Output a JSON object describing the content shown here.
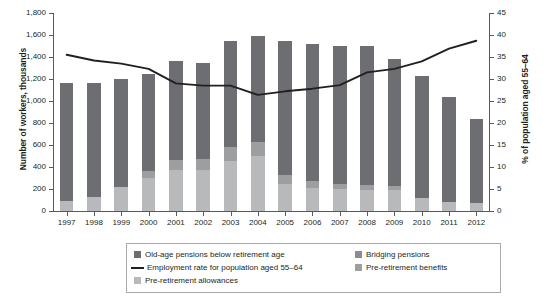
{
  "chart_data": {
    "type": "bar",
    "subtype": "stacked-bar-with-line-overlay",
    "title": "",
    "xlabel": "",
    "ylabel": "Number of workers, thousands",
    "y2label": "% of population aged 55–64",
    "ylim": [
      0,
      1800
    ],
    "y2lim": [
      0,
      45
    ],
    "ytick_step": 200,
    "y2tick_step": 5,
    "grid": false,
    "legend_position": "bottom",
    "categories": [
      "1997",
      "1998",
      "1999",
      "2000",
      "2001",
      "2002",
      "2003",
      "2004",
      "2005",
      "2006",
      "2007",
      "2008",
      "2009",
      "2010",
      "2011",
      "2012"
    ],
    "ytick_labels": [
      "0",
      "200",
      "400",
      "600",
      "800",
      "1,000",
      "1,200",
      "1,400",
      "1,600",
      "1,800"
    ],
    "y2tick_labels": [
      "0",
      "5",
      "10",
      "15",
      "20",
      "25",
      "30",
      "35",
      "40",
      "45"
    ],
    "series": [
      {
        "name": "Pre-retirement allowances",
        "kind": "bar-segment",
        "color": "#b8b9bb",
        "stack_order": 1,
        "values": [
          95,
          125,
          215,
          300,
          375,
          370,
          455,
          500,
          250,
          210,
          200,
          195,
          195,
          120,
          80,
          70
        ]
      },
      {
        "name": "Pre-retirement benefits",
        "kind": "bar-segment",
        "color": "#9c9e a0",
        "stack_order": 2,
        "values": [
          0,
          0,
          0,
          60,
          85,
          100,
          130,
          130,
          80,
          60,
          45,
          40,
          35,
          0,
          0,
          0
        ]
      },
      {
        "name": "Bridging pensions",
        "kind": "bar-segment",
        "color": "#8a8c8e",
        "stack_order": 3,
        "values": [
          0,
          0,
          0,
          0,
          0,
          0,
          0,
          0,
          0,
          0,
          0,
          0,
          0,
          0,
          0,
          0
        ]
      },
      {
        "name": "Old-age pensions below retirement age",
        "kind": "bar-segment",
        "color": "#6d6e71",
        "stack_order": 4,
        "values": [
          1065,
          1040,
          985,
          885,
          900,
          880,
          965,
          960,
          1215,
          1250,
          1255,
          1265,
          1150,
          1105,
          955,
          770
        ]
      },
      {
        "name": "Employment rate for population aged 55–64",
        "kind": "line",
        "axis": "right",
        "color": "#231f20",
        "values": [
          35.5,
          34.2,
          33.5,
          32.3,
          29.0,
          28.5,
          28.5,
          26.4,
          27.2,
          27.8,
          28.6,
          31.5,
          32.3,
          34.0,
          36.9,
          38.7
        ]
      }
    ],
    "bar_totals": [
      1160,
      1165,
      1200,
      1245,
      1360,
      1350,
      1550,
      1590,
      1545,
      1520,
      1500,
      1500,
      1380,
      1225,
      1035,
      840
    ]
  },
  "axes": {
    "left": {
      "title": "Number of workers, thousands"
    },
    "right": {
      "title": "% of population aged 55–64"
    }
  },
  "legend": {
    "items": [
      {
        "label": "Old-age pensions below retirement age",
        "marker": "square-swatch",
        "color": "#6d6e71",
        "column": "a"
      },
      {
        "label": "Employment rate for population aged 55–64",
        "marker": "line-swatch",
        "color": "#231f20",
        "column": "a"
      },
      {
        "label": "Pre-retirement allowances",
        "marker": "square-swatch",
        "color": "#b8b9bb",
        "column": "a"
      },
      {
        "label": "Bridging pensions",
        "marker": "square-swatch",
        "color": "#8a8c8e",
        "column": "b"
      },
      {
        "label": "Pre-retirement benefits",
        "marker": "square-swatch",
        "color": "#9c9ea0",
        "column": "b"
      }
    ]
  },
  "colors": {
    "segment_old_age": "#6d6e71",
    "segment_bridging": "#8a8c8e",
    "segment_prebenefits": "#9c9ea0",
    "segment_preallowances": "#b8b9bb",
    "line": "#231f20",
    "axis": "#58595b",
    "text": "#231f20",
    "legend_border": "#a7a9ac",
    "background": "#ffffff"
  }
}
